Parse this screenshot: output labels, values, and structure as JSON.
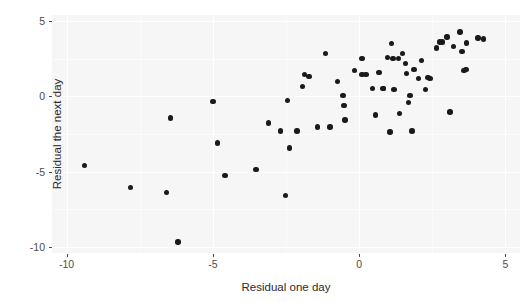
{
  "chart_data": {
    "type": "scatter",
    "title": "",
    "xlabel": "Residual one day",
    "ylabel": "Residual the next day",
    "xlim": [
      -10.5,
      5.5
    ],
    "ylim": [
      -10.4,
      5.4
    ],
    "xticks": [
      -10,
      -5,
      0,
      5
    ],
    "xticklabels": [
      "-10",
      "-5",
      "0",
      "5"
    ],
    "yticks": [
      -10,
      -5,
      0,
      5
    ],
    "yticklabels": [
      "-10",
      "-5",
      "0",
      "5"
    ],
    "grid": true,
    "legend": "none",
    "marker": "filled-circle",
    "marker_color": "#1a1a1a",
    "panel_background": "#f6f6f6",
    "gridline_color": "#ffffff",
    "n_points": 66,
    "points": [
      {
        "x": -9.39,
        "y": -4.61
      },
      {
        "x": -7.81,
        "y": -6.05
      },
      {
        "x": -6.58,
        "y": -6.38
      },
      {
        "x": -6.45,
        "y": -1.45
      },
      {
        "x": -6.19,
        "y": -9.67
      },
      {
        "x": -5.0,
        "y": -0.33
      },
      {
        "x": -4.84,
        "y": -3.09
      },
      {
        "x": -4.58,
        "y": -5.26
      },
      {
        "x": -3.52,
        "y": -4.87
      },
      {
        "x": -3.1,
        "y": -1.78
      },
      {
        "x": -2.68,
        "y": -2.3
      },
      {
        "x": -2.52,
        "y": -6.58
      },
      {
        "x": -2.45,
        "y": -0.26
      },
      {
        "x": -2.39,
        "y": -3.42
      },
      {
        "x": -2.13,
        "y": -2.3
      },
      {
        "x": -1.94,
        "y": 0.66
      },
      {
        "x": -1.87,
        "y": 1.45
      },
      {
        "x": -1.71,
        "y": 1.32
      },
      {
        "x": -1.42,
        "y": -2.04
      },
      {
        "x": -1.16,
        "y": 2.83
      },
      {
        "x": -0.74,
        "y": 0.99
      },
      {
        "x": -0.55,
        "y": 0.07
      },
      {
        "x": -0.52,
        "y": -0.59
      },
      {
        "x": -0.48,
        "y": -1.58
      },
      {
        "x": 0.1,
        "y": 2.5
      },
      {
        "x": 0.1,
        "y": 1.45
      },
      {
        "x": 0.23,
        "y": 1.45
      },
      {
        "x": 0.45,
        "y": 0.53
      },
      {
        "x": 0.55,
        "y": -1.25
      },
      {
        "x": 0.68,
        "y": 1.58
      },
      {
        "x": 0.81,
        "y": 0.53
      },
      {
        "x": 0.84,
        "y": 0.53
      },
      {
        "x": 1.06,
        "y": -2.37
      },
      {
        "x": 1.1,
        "y": 3.49
      },
      {
        "x": 1.16,
        "y": 2.5
      },
      {
        "x": 1.19,
        "y": 0.46
      },
      {
        "x": 1.35,
        "y": 2.5
      },
      {
        "x": 1.39,
        "y": -1.12
      },
      {
        "x": 1.48,
        "y": 2.83
      },
      {
        "x": 1.58,
        "y": 2.17
      },
      {
        "x": 1.61,
        "y": 1.51
      },
      {
        "x": 1.68,
        "y": -0.39
      },
      {
        "x": 1.74,
        "y": 0.07
      },
      {
        "x": 1.81,
        "y": -2.3
      },
      {
        "x": 1.87,
        "y": 1.78
      },
      {
        "x": 2.03,
        "y": 1.18
      },
      {
        "x": 2.13,
        "y": 2.37
      },
      {
        "x": 2.35,
        "y": 1.25
      },
      {
        "x": 2.42,
        "y": 1.18
      },
      {
        "x": 2.65,
        "y": 3.22
      },
      {
        "x": 2.77,
        "y": 3.62
      },
      {
        "x": 2.84,
        "y": 3.62
      },
      {
        "x": 3.0,
        "y": 3.95
      },
      {
        "x": 3.1,
        "y": -1.05
      },
      {
        "x": 3.23,
        "y": 3.29
      },
      {
        "x": 3.45,
        "y": 4.28
      },
      {
        "x": 3.52,
        "y": 2.96
      },
      {
        "x": 3.58,
        "y": 1.71
      },
      {
        "x": 3.65,
        "y": 1.78
      },
      {
        "x": 3.68,
        "y": 3.55
      },
      {
        "x": 4.06,
        "y": 3.88
      },
      {
        "x": 4.26,
        "y": 3.81
      },
      {
        "x": 0.97,
        "y": 2.57
      },
      {
        "x": -0.16,
        "y": 1.71
      },
      {
        "x": 2.26,
        "y": 0.46
      },
      {
        "x": -1.0,
        "y": -2.04
      }
    ]
  },
  "axes": {
    "x_title": "Residual one day",
    "y_title": "Residual the next day"
  }
}
